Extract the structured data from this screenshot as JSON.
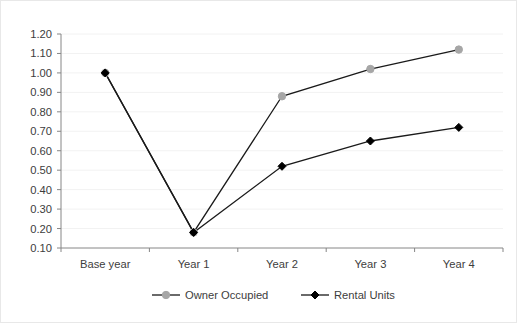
{
  "chart_data": {
    "type": "line",
    "title": "",
    "subtitle": "",
    "xlabel": "",
    "ylabel": "",
    "categories": [
      "Base year",
      "Year 1",
      "Year 2",
      "Year 3",
      "Year 4"
    ],
    "series": [
      {
        "name": "Owner Occupied",
        "marker": "circle",
        "color": "#a6a6a6",
        "line_color": "#1a1a1a",
        "values": [
          1.0,
          0.18,
          0.88,
          1.02,
          1.12
        ]
      },
      {
        "name": "Rental Units",
        "marker": "diamond",
        "color": "#000000",
        "line_color": "#1a1a1a",
        "values": [
          1.0,
          0.18,
          0.52,
          0.65,
          0.72
        ]
      }
    ],
    "ylim": [
      0.1,
      1.2
    ],
    "ytick_values": [
      0.1,
      0.2,
      0.3,
      0.4,
      0.5,
      0.6,
      0.7,
      0.8,
      0.9,
      1.0,
      1.1,
      1.2
    ],
    "ytick_labels": [
      "0.10",
      "0.20",
      "0.30",
      "0.40",
      "0.50",
      "0.60",
      "0.70",
      "0.80",
      "0.90",
      "1.00",
      "1.10",
      "1.20"
    ],
    "grid": true,
    "grid_color": "#f2f2f2",
    "legend_position": "bottom",
    "axis_color": "#868686",
    "background": "#ffffff",
    "border_color": "#e8e8e8"
  }
}
